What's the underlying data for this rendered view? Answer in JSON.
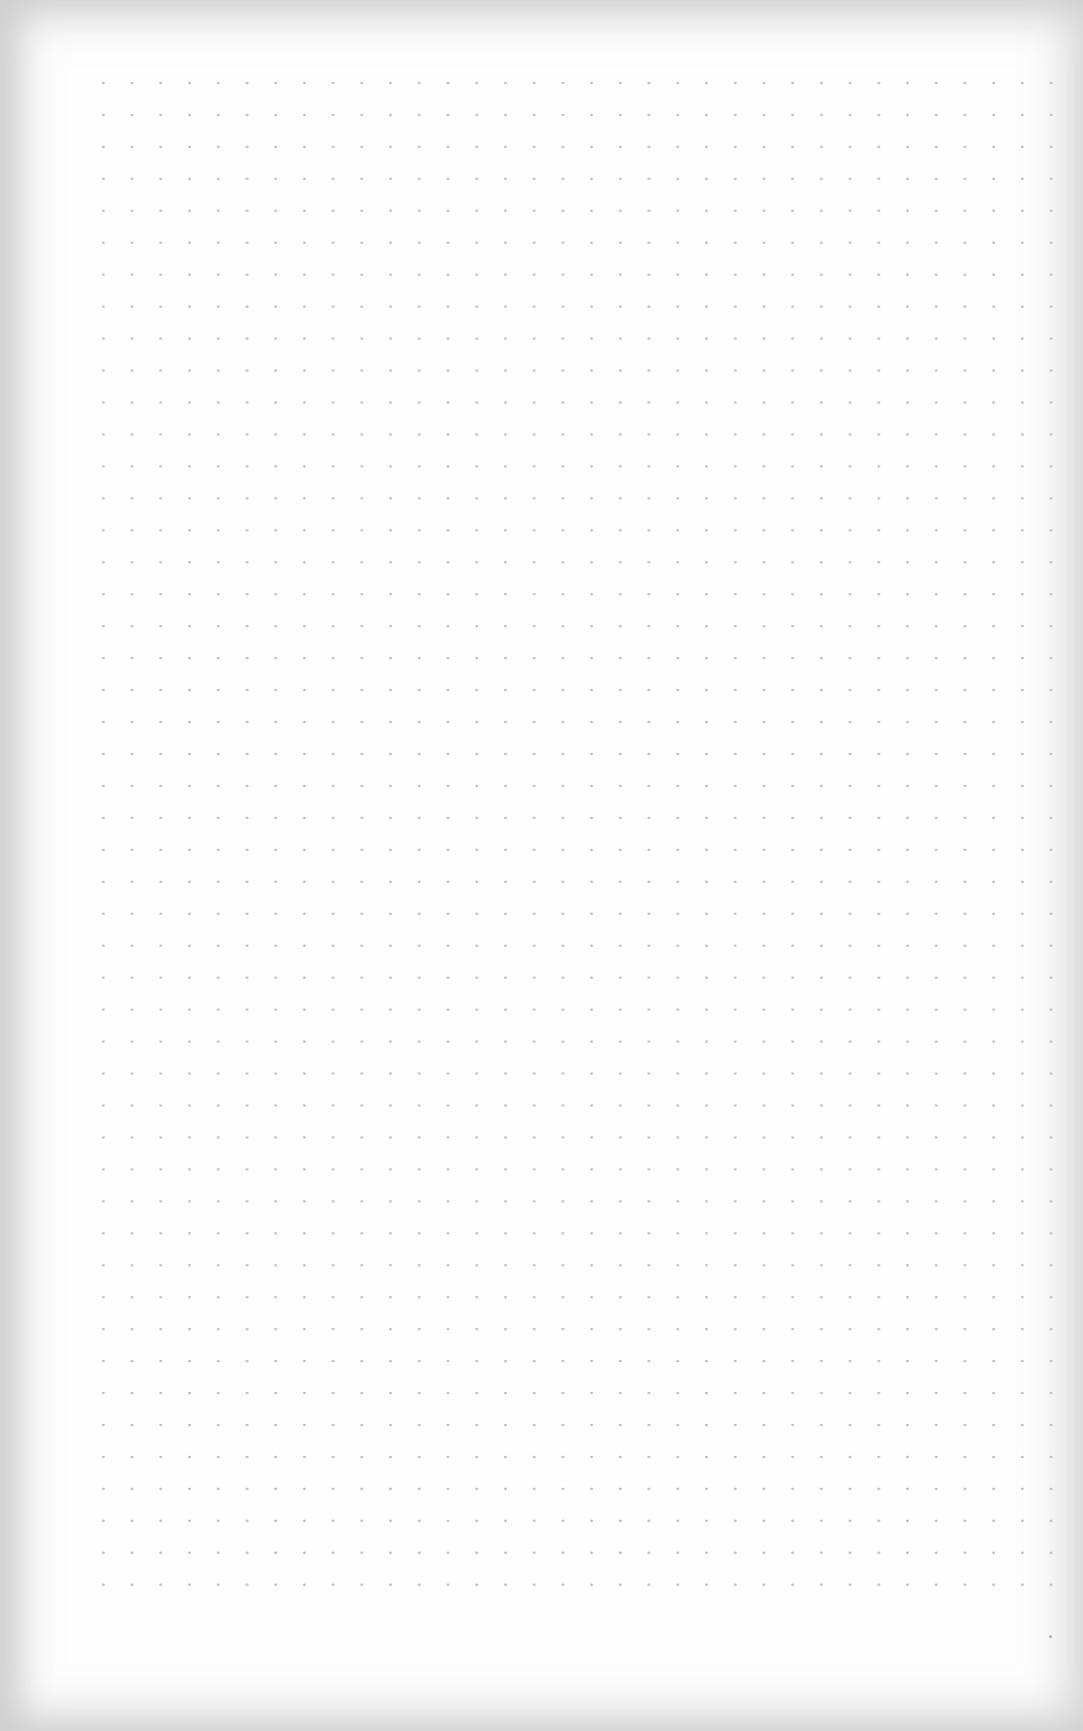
{
  "page": {
    "type": "dot-grid-paper",
    "grid": {
      "columns": 35,
      "rows": 49,
      "dot_color": "#b8b8b8",
      "paper_color": "#fdfdfd",
      "edge_shadow_color": "#e9e9e9"
    }
  }
}
